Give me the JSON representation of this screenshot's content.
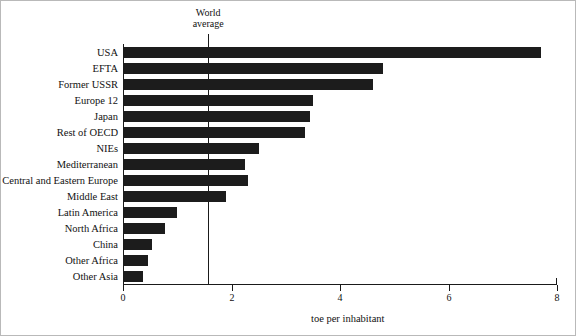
{
  "chart_data": {
    "type": "bar",
    "orientation": "horizontal",
    "title": "",
    "xlabel": "toe per inhabitant",
    "ylabel": "",
    "xlim": [
      0,
      8
    ],
    "xticks": [
      0,
      2,
      4,
      6,
      8
    ],
    "xtick_labels": [
      "0",
      "2",
      "4",
      "6",
      "8"
    ],
    "grid": false,
    "legend": null,
    "bar_color": "#1c1c1c",
    "categories": [
      "USA",
      "EFTA",
      "Former USSR",
      "Europe 12",
      "Japan",
      "Rest of OECD",
      "NIEs",
      "Mediterranean",
      "Central and Eastern Europe",
      "Middle East",
      "Latin America",
      "North Africa",
      "China",
      "Other Africa",
      "Other Asia"
    ],
    "values": [
      7.7,
      4.8,
      4.6,
      3.5,
      3.45,
      3.35,
      2.5,
      2.25,
      2.3,
      1.9,
      1.0,
      0.78,
      0.53,
      0.46,
      0.37
    ],
    "annotations": [
      {
        "name": "world-average",
        "label_line1": "World",
        "label_line2": "average",
        "x": 1.57,
        "color": "#1a1a1a"
      }
    ]
  }
}
